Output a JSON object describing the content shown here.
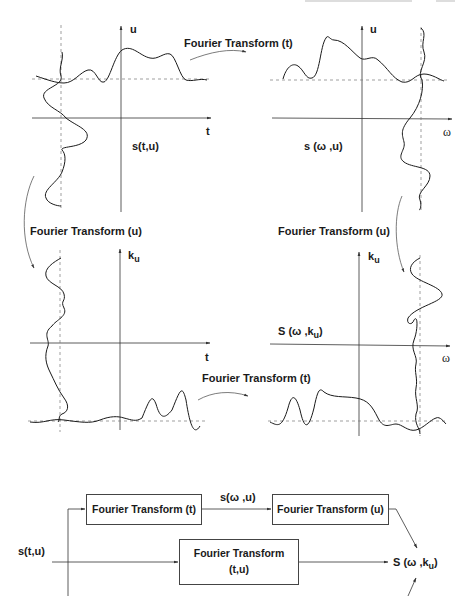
{
  "figure": {
    "header_fragment": "",
    "panels": {
      "top_left": {
        "vertical_axis_label": "u",
        "horizontal_axis_label": "t",
        "signal_label": "s(t,u)"
      },
      "top_right": {
        "vertical_axis_label": "u",
        "horizontal_axis_label": "ω",
        "signal_label_main": "s (ω ,u)"
      },
      "bottom_left": {
        "vertical_axis_label": "k",
        "vertical_axis_subscript": "u",
        "horizontal_axis_label": "t"
      },
      "bottom_right": {
        "vertical_axis_label": "k",
        "vertical_axis_subscript": "u",
        "horizontal_axis_label": "ω",
        "signal_label_prefix": "S (ω ,k",
        "signal_label_subscript": "u",
        "signal_label_suffix": ")"
      }
    },
    "transform_arrows": {
      "top": "Fourier Transform (t)",
      "left": "Fourier Transform (u)",
      "right": "Fourier Transform (u)",
      "bottom": "Fourier Transform (t)"
    },
    "block_diagram": {
      "input_label": "s(t,u)",
      "box_ft_t": "Fourier Transform (t)",
      "intermediate_label": "s(ω ,u)",
      "box_ft_u": "Fourier Transform (u)",
      "box_ft_tu_line1": "Fourier Transform",
      "box_ft_tu_line2": "(t,u)",
      "output_prefix": "S (ω ,k",
      "output_subscript": "u",
      "output_suffix": ")"
    },
    "colors": {
      "ink": "#1a1a1a",
      "axis": "#333333",
      "dashed": "#777777",
      "background": "#ffffff"
    }
  }
}
